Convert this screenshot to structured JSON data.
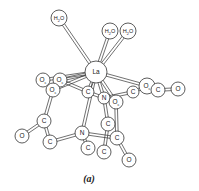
{
  "figure": {
    "caption": "(a)",
    "colors": {
      "stroke": "#333333",
      "fill": "#ffffff",
      "text": "#222222"
    }
  },
  "atoms": [
    {
      "id": "w1",
      "label": "H2O",
      "x": 59,
      "y": 18,
      "r": 8
    },
    {
      "id": "w2",
      "label": "H2O",
      "x": 110,
      "y": 31,
      "r": 8
    },
    {
      "id": "w3",
      "label": "H2O",
      "x": 128,
      "y": 31,
      "r": 8
    },
    {
      "id": "la",
      "label": "La",
      "x": 96,
      "y": 72,
      "r": 11
    },
    {
      "id": "oc1",
      "label": "Oc",
      "x": 43,
      "y": 80,
      "r": 7
    },
    {
      "id": "oc2",
      "label": "Oc",
      "x": 60,
      "y": 80,
      "r": 7
    },
    {
      "id": "oc3",
      "label": "Oc",
      "x": 53,
      "y": 90,
      "r": 7
    },
    {
      "id": "c1",
      "label": "C",
      "x": 88,
      "y": 92,
      "r": 6
    },
    {
      "id": "n1",
      "label": "N",
      "x": 104,
      "y": 98,
      "r": 6
    },
    {
      "id": "oc4",
      "label": "Oc",
      "x": 116,
      "y": 102,
      "r": 7
    },
    {
      "id": "c2",
      "label": "C",
      "x": 133,
      "y": 92,
      "r": 6
    },
    {
      "id": "oc5",
      "label": "Oc",
      "x": 147,
      "y": 86,
      "r": 8
    },
    {
      "id": "c3",
      "label": "C",
      "x": 158,
      "y": 90,
      "r": 7
    },
    {
      "id": "o1",
      "label": "O",
      "x": 178,
      "y": 89,
      "r": 7
    },
    {
      "id": "c4",
      "label": "C",
      "x": 44,
      "y": 121,
      "r": 7
    },
    {
      "id": "o2",
      "label": "O",
      "x": 22,
      "y": 136,
      "r": 7
    },
    {
      "id": "c5",
      "label": "C",
      "x": 50,
      "y": 142,
      "r": 7
    },
    {
      "id": "n2",
      "label": "N",
      "x": 82,
      "y": 133,
      "r": 7
    },
    {
      "id": "c6",
      "label": "C",
      "x": 88,
      "y": 148,
      "r": 7
    },
    {
      "id": "c7",
      "label": "C",
      "x": 108,
      "y": 124,
      "r": 7
    },
    {
      "id": "c8",
      "label": "C",
      "x": 117,
      "y": 138,
      "r": 7
    },
    {
      "id": "c9",
      "label": "C",
      "x": 104,
      "y": 152,
      "r": 7
    },
    {
      "id": "o3",
      "label": "O",
      "x": 129,
      "y": 160,
      "r": 7
    }
  ],
  "bonds": [
    [
      "la",
      "w1"
    ],
    [
      "la",
      "w2"
    ],
    [
      "la",
      "w3"
    ],
    [
      "la",
      "oc1"
    ],
    [
      "la",
      "oc2"
    ],
    [
      "la",
      "oc3"
    ],
    [
      "la",
      "c1"
    ],
    [
      "la",
      "n1"
    ],
    [
      "la",
      "oc4"
    ],
    [
      "la",
      "oc5"
    ],
    [
      "la",
      "n2"
    ],
    [
      "oc2",
      "c1"
    ],
    [
      "oc3",
      "c4"
    ],
    [
      "c4",
      "o2"
    ],
    [
      "c4",
      "c5"
    ],
    [
      "c5",
      "n2"
    ],
    [
      "n2",
      "c6"
    ],
    [
      "n2",
      "c8"
    ],
    [
      "n1",
      "c7"
    ],
    [
      "oc4",
      "c8"
    ],
    [
      "c7",
      "c9"
    ],
    [
      "c8",
      "o3"
    ],
    [
      "c2",
      "oc5"
    ],
    [
      "oc5",
      "c3"
    ],
    [
      "c3",
      "o1"
    ],
    [
      "n1",
      "c2"
    ],
    [
      "c1",
      "n1"
    ]
  ]
}
